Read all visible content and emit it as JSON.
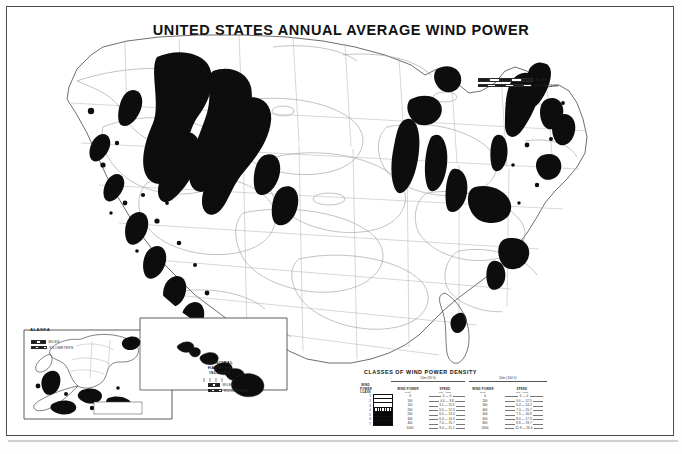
{
  "document": {
    "title": "UNITED STATES ANNUAL AVERAGE WIND POWER",
    "background_color": "#ffffff",
    "frame_color": "#4a4a4a"
  },
  "map": {
    "name": "contiguous-united-states-wind-power-map",
    "shading_description": "black = highest wind power classes, white/gray contours = lower classes",
    "contour_color": "#9a9a9a",
    "high_class_fill": "#0d0d0d"
  },
  "main_scalebar": {
    "miles_label": "MILES",
    "kilometers_label": "KILOMETERS",
    "miles_ticks": [
      "0",
      "100",
      "200",
      "300",
      "400"
    ],
    "km_ticks": [
      "0",
      "200",
      "400",
      "600"
    ]
  },
  "insets": {
    "alaska": {
      "label": "ALASKA",
      "scale_miles_label": "MILES",
      "scale_km_label": "KILOMETERS"
    },
    "hawaii": {
      "label_line1": "PRINCIPAL",
      "label_line2": "HAWAIIAN",
      "label_line3": "ISLANDS",
      "scale_miles_label": "MILES",
      "scale_km_label": "KILOMETERS"
    }
  },
  "legend": {
    "title": "CLASSES OF WIND POWER DENSITY",
    "height_group_1": "10m (33 ft)",
    "height_group_2": "50m (164 ft)",
    "columns": {
      "class_line1": "WIND",
      "class_line2": "POWER",
      "class_line3": "CLASS",
      "power_line1": "WIND POWER",
      "power_line2": "W/m²",
      "speed_line1": "SPEED",
      "speed_line2": "m/s",
      "speed_line3": "mph"
    },
    "rows": [
      {
        "class": "1",
        "swatch": "white",
        "wp10": "0",
        "sp10ms": "0",
        "sp10mph": "0",
        "wp50": "0",
        "sp50ms": "0",
        "sp50mph": "0"
      },
      {
        "class": "2",
        "swatch": "white",
        "wp10": "100",
        "sp10ms": "4.4",
        "sp10mph": "9.8",
        "wp50": "200",
        "sp50ms": "5.6",
        "sp50mph": "12.5"
      },
      {
        "class": "3",
        "swatch": "white",
        "wp10": "150",
        "sp10ms": "5.1",
        "sp10mph": "11.5",
        "wp50": "300",
        "sp50ms": "6.4",
        "sp50mph": "14.3"
      },
      {
        "class": "4",
        "swatch": "hatch",
        "wp10": "200",
        "sp10ms": "5.6",
        "sp10mph": "12.5",
        "wp50": "400",
        "sp50ms": "7.0",
        "sp50mph": "15.7"
      },
      {
        "class": "5",
        "swatch": "black",
        "wp10": "250",
        "sp10ms": "6.0",
        "sp10mph": "13.4",
        "wp50": "500",
        "sp50ms": "7.5",
        "sp50mph": "16.8"
      },
      {
        "class": "6",
        "swatch": "black",
        "wp10": "300",
        "sp10ms": "6.4",
        "sp10mph": "14.3",
        "wp50": "600",
        "sp50ms": "8.0",
        "sp50mph": "17.9"
      },
      {
        "class": "7",
        "swatch": "black",
        "wp10": "400",
        "sp10ms": "7.0",
        "sp10mph": "15.7",
        "wp50": "800",
        "sp50ms": "8.8",
        "sp50mph": "19.7"
      },
      {
        "class": "",
        "swatch": "none",
        "wp10": "1000",
        "sp10ms": "9.4",
        "sp10mph": "21.1",
        "wp50": "2000",
        "sp50ms": "11.9",
        "sp50mph": "26.6"
      }
    ]
  }
}
